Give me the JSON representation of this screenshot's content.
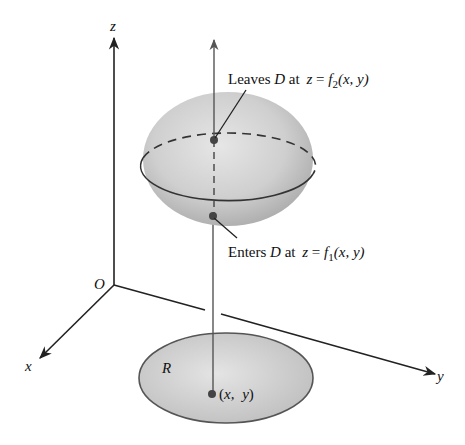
{
  "figure": {
    "type": "3d-region-diagram",
    "axes": {
      "z_label": "z",
      "x_label": "x",
      "y_label": "y",
      "origin_label": "O"
    },
    "solid": {
      "name": "D",
      "fill_color": "#c8c8c8"
    },
    "region": {
      "label": "R",
      "point_label": "(x,  y)",
      "fill_color": "#cfcfcf"
    },
    "annotations": {
      "leaves": {
        "prefix": "Leaves ",
        "set": "D",
        "middle": " at ",
        "var": "z",
        "eq": " = ",
        "func": "f",
        "sub": "2",
        "args": "(x,  y)"
      },
      "enters": {
        "prefix": "Enters ",
        "set": "D",
        "middle": " at ",
        "var": "z",
        "eq": " = ",
        "func": "f",
        "sub": "1",
        "args": "(x,  y)"
      }
    },
    "colors": {
      "line": "#222222",
      "vertical_line": "#555555",
      "dot": "#444444"
    }
  }
}
